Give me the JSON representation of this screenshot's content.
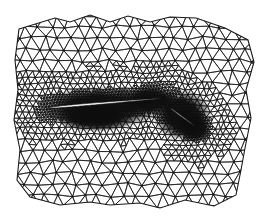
{
  "figure": {
    "background_color": "#ffffff",
    "line_color": "#1a1a1a",
    "fill_dense_color": "#0d0d0d",
    "airfoil_fill_color": "#ffffff"
  },
  "domain": {
    "outer_boundary": [
      [
        19,
        29
      ],
      [
        55,
        18
      ],
      [
        70,
        22
      ],
      [
        90,
        15
      ],
      [
        110,
        22
      ],
      [
        128,
        16
      ],
      [
        150,
        22
      ],
      [
        170,
        17
      ],
      [
        196,
        18
      ],
      [
        225,
        28
      ],
      [
        248,
        40
      ],
      [
        254,
        62
      ],
      [
        246,
        90
      ],
      [
        251,
        118
      ],
      [
        245,
        148
      ],
      [
        241,
        170
      ],
      [
        236,
        195
      ],
      [
        214,
        206
      ],
      [
        185,
        200
      ],
      [
        160,
        208
      ],
      [
        140,
        203
      ],
      [
        110,
        205
      ],
      [
        90,
        202
      ],
      [
        60,
        205
      ],
      [
        30,
        197
      ],
      [
        17,
        180
      ],
      [
        20,
        150
      ],
      [
        14,
        120
      ],
      [
        18,
        90
      ],
      [
        15,
        60
      ]
    ]
  },
  "airfoils": [
    {
      "name": "main-element",
      "leading_edge": [
        48,
        108
      ],
      "trailing_edge": [
        165,
        98
      ],
      "thickness": 12
    },
    {
      "name": "flap-element",
      "leading_edge": [
        170,
        108
      ],
      "trailing_edge": [
        196,
        127
      ],
      "thickness": 5
    }
  ],
  "mesh": {
    "coarse_spacing": 13,
    "fine_spacing": 3.2,
    "refinement_radius": 48,
    "jitter": 0.28
  }
}
